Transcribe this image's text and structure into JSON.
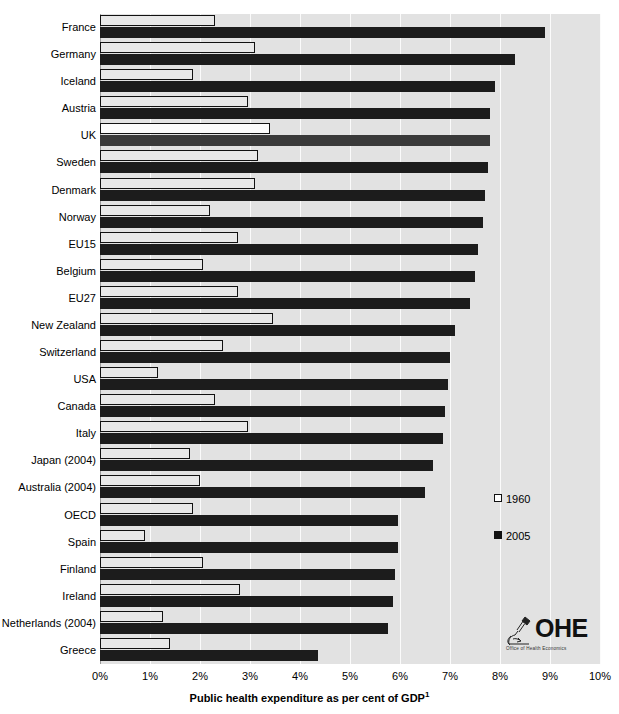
{
  "chart_data": {
    "type": "bar",
    "orientation": "horizontal",
    "title": "",
    "xlabel": "Public health expenditure as per cent of GDP",
    "xlabel_superscript": "1",
    "ylabel": "",
    "xlim": [
      0,
      10
    ],
    "x_ticks": [
      "0%",
      "1%",
      "2%",
      "3%",
      "4%",
      "5%",
      "6%",
      "7%",
      "8%",
      "9%",
      "10%"
    ],
    "x_tick_values": [
      0,
      1,
      2,
      3,
      4,
      5,
      6,
      7,
      8,
      9,
      10
    ],
    "grid": true,
    "grid_axis": "x",
    "legend_position": "right-middle",
    "categories": [
      "France",
      "Germany",
      "Iceland",
      "Austria",
      "UK",
      "Sweden",
      "Denmark",
      "Norway",
      "EU15",
      "Belgium",
      "EU27",
      "New Zealand",
      "Switzerland",
      "USA",
      "Canada",
      "Italy",
      "Japan (2004)",
      "Australia (2004)",
      "OECD",
      "Spain",
      "Finland",
      "Ireland",
      "Netherlands (2004)",
      "Greece"
    ],
    "highlighted_category": "UK",
    "series": [
      {
        "name": "1960",
        "color": "#e8e8e8",
        "values": [
          2.3,
          3.1,
          1.85,
          2.95,
          3.4,
          3.15,
          3.1,
          2.2,
          2.75,
          2.05,
          2.75,
          3.45,
          2.45,
          1.15,
          2.3,
          2.95,
          1.8,
          2.0,
          1.85,
          0.9,
          2.05,
          2.8,
          1.25,
          1.4
        ]
      },
      {
        "name": "2005",
        "color": "#1c1c1c",
        "values": [
          8.9,
          8.3,
          7.9,
          7.8,
          7.8,
          7.75,
          7.7,
          7.65,
          7.55,
          7.5,
          7.4,
          7.1,
          7.0,
          6.95,
          6.9,
          6.85,
          6.65,
          6.5,
          5.95,
          5.95,
          5.9,
          5.85,
          5.75,
          4.35
        ]
      }
    ]
  },
  "legend": {
    "items": [
      {
        "label": "1960",
        "swatch": "open-square-icon"
      },
      {
        "label": "2005",
        "swatch": "filled-square-icon"
      }
    ]
  },
  "logo": {
    "name": "ohe-logo",
    "wordmark": "OHE",
    "subtitle": "Office of Health Economics"
  }
}
